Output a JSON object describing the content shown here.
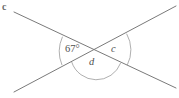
{
  "figure": {
    "type": "geometry-diagram",
    "background_color": "#ffffff",
    "line_color": "#7a7a7a",
    "arc_color": "#9a9a9a",
    "label_color": "#4f4f4f",
    "lines": [
      {
        "name": "descending-line",
        "x1": 14,
        "y1": 12,
        "x2": 176,
        "y2": 88
      },
      {
        "name": "ascending-line",
        "x1": 14,
        "y1": 92,
        "x2": 176,
        "y2": 6
      }
    ],
    "intersection": {
      "x": 96,
      "y": 50
    },
    "arcs": [
      {
        "name": "left-angle-arc",
        "path": "M 62.5 36.7 A 36 36 0 0 0 62.0 65.1",
        "angle_position": "left"
      },
      {
        "name": "right-angle-arc",
        "path": "M 126.6 33.7 A 33 33 0 0 1 127.2 65.2",
        "angle_position": "right"
      },
      {
        "name": "bottom-angle-arc",
        "path": "M 71.7 62.0 A 26 26 0 0 0 120.7 62.9",
        "angle_position": "bottom"
      }
    ],
    "labels": {
      "exterior_c": "c",
      "angle_67": "67°",
      "angle_c": "c",
      "angle_d": "d"
    }
  }
}
